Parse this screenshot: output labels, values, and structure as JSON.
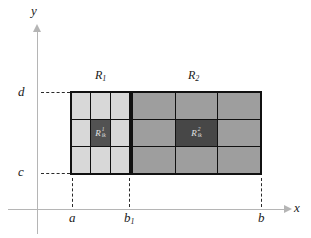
{
  "colors": {
    "background": "#ffffff",
    "axis": "#b5b5b5",
    "grid_line": "#111111",
    "dash": "#2a2a2a",
    "text": "#1a1a1a",
    "r1_cell_fill": "#d8d8d8",
    "r1_highlight_fill": "#525252",
    "r2_cell_fill": "#9e9e9e",
    "r2_highlight_fill": "#474747",
    "highlight_label_color": "#e3e3e3"
  },
  "axes": {
    "x_label": "x",
    "y_label": "y"
  },
  "y_ticks": {
    "d": "d",
    "c": "c"
  },
  "x_ticks": {
    "a": "a",
    "b1_base": "b",
    "b1_sub": "1",
    "b": "b"
  },
  "regions": {
    "r1": {
      "title_base": "R",
      "title_sub": "1",
      "grid_rows": 3,
      "grid_cols": 3,
      "highlight": {
        "row": 2,
        "col": 2,
        "label_base": "R",
        "label_sup": "1",
        "label_sub": "ik"
      }
    },
    "r2": {
      "title_base": "R",
      "title_sub": "2",
      "grid_rows": 3,
      "grid_cols": 3,
      "highlight": {
        "row": 2,
        "col": 2,
        "label_base": "R",
        "label_sup": "2",
        "label_sub": "ik"
      }
    }
  }
}
